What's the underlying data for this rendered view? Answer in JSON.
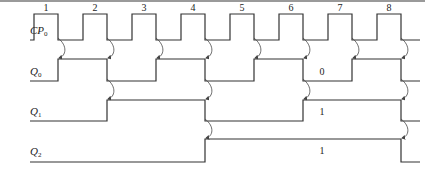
{
  "diagram": {
    "title": "",
    "line_color": "#333333",
    "arrow_color": "#444444",
    "x_start": 10,
    "x_end": 420,
    "signals": [
      {
        "name": "CP",
        "sub": "0",
        "label_y": 34,
        "high_y": 14,
        "low_y": 40,
        "initial": 0,
        "edges": [
          34,
          58,
          83,
          107,
          132,
          156,
          181,
          205,
          230,
          254,
          279,
          303,
          328,
          352,
          377,
          401
        ]
      },
      {
        "name": "Q",
        "sub": "0",
        "label_y": 75,
        "high_y": 59,
        "low_y": 81,
        "initial": 0,
        "edges": [
          58,
          107,
          156,
          205,
          254,
          303,
          352,
          401
        ]
      },
      {
        "name": "Q",
        "sub": "1",
        "label_y": 115,
        "high_y": 100,
        "low_y": 121,
        "initial": 0,
        "edges": [
          107,
          205,
          303,
          401
        ]
      },
      {
        "name": "Q",
        "sub": "2",
        "label_y": 155,
        "high_y": 139,
        "low_y": 162,
        "initial": 0,
        "edges": [
          205,
          401
        ]
      }
    ],
    "pulse_numbers": [
      {
        "text": "1",
        "x": 46,
        "y": 11
      },
      {
        "text": "2",
        "x": 95,
        "y": 11
      },
      {
        "text": "3",
        "x": 144,
        "y": 11
      },
      {
        "text": "4",
        "x": 193,
        "y": 11
      },
      {
        "text": "5",
        "x": 242,
        "y": 11
      },
      {
        "text": "6",
        "x": 291,
        "y": 11
      },
      {
        "text": "7",
        "x": 340,
        "y": 11
      },
      {
        "text": "8",
        "x": 389,
        "y": 11
      }
    ],
    "state_labels": [
      {
        "text": "0",
        "x": 322,
        "y": 75
      },
      {
        "text": "1",
        "x": 322,
        "y": 115
      },
      {
        "text": "1",
        "x": 322,
        "y": 154
      }
    ],
    "arrows": [
      {
        "x": 58,
        "y1": 42,
        "y2": 58
      },
      {
        "x": 107,
        "y1": 42,
        "y2": 58
      },
      {
        "x": 156,
        "y1": 42,
        "y2": 58
      },
      {
        "x": 205,
        "y1": 42,
        "y2": 58
      },
      {
        "x": 254,
        "y1": 42,
        "y2": 58
      },
      {
        "x": 303,
        "y1": 42,
        "y2": 58
      },
      {
        "x": 352,
        "y1": 42,
        "y2": 58
      },
      {
        "x": 401,
        "y1": 42,
        "y2": 58
      },
      {
        "x": 107,
        "y1": 83,
        "y2": 99
      },
      {
        "x": 205,
        "y1": 83,
        "y2": 99
      },
      {
        "x": 303,
        "y1": 83,
        "y2": 99
      },
      {
        "x": 401,
        "y1": 83,
        "y2": 99
      },
      {
        "x": 205,
        "y1": 123,
        "y2": 138
      },
      {
        "x": 401,
        "y1": 123,
        "y2": 138
      }
    ]
  }
}
